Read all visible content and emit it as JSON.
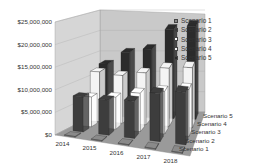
{
  "chart_data": {
    "type": "bar",
    "subtype": "3d-column",
    "title": "",
    "xlabel": "",
    "ylabel": "",
    "categories": [
      "2014",
      "2015",
      "2016",
      "2017",
      "2018"
    ],
    "series": [
      {
        "name": "Scenario 1",
        "values": [
          0,
          0,
          0,
          0,
          0
        ],
        "color": "#8a8a8a"
      },
      {
        "name": "Scenario 2",
        "values": [
          8000000,
          8000000,
          8500000,
          11000000,
          12000000
        ],
        "color": "#3d3d3d"
      },
      {
        "name": "Scenario 3",
        "values": [
          7000000,
          7500000,
          9000000,
          10000000,
          11000000
        ],
        "color": "#ffffff"
      },
      {
        "name": "Scenario 4",
        "values": [
          12000000,
          11500000,
          12500000,
          14000000,
          14500000
        ],
        "color": "#f4f4f4"
      },
      {
        "name": "Scenario 5",
        "values": [
          13000000,
          16000000,
          17000000,
          22000000,
          23000000
        ],
        "color": "#2b2b2b"
      }
    ],
    "ylim": [
      0,
      25000000
    ],
    "yticks": [
      "$0",
      "$5,000,000",
      "$10,000,000",
      "$15,000,000",
      "$20,000,000",
      "$25,000,000"
    ],
    "grid": true,
    "legend_position": "right",
    "depth_axis_labels": [
      "Scenario 5",
      "Scenario 4",
      "Scenario 3",
      "Scenario 2",
      "Scenario 1"
    ]
  },
  "legend": {
    "items": [
      {
        "label": "Scenario 1",
        "color": "#8a8a8a"
      },
      {
        "label": "Scenario 2",
        "color": "#3d3d3d"
      },
      {
        "label": "Scenario 3",
        "color": "#ffffff"
      },
      {
        "label": "Scenario 4",
        "color": "#f4f4f4"
      },
      {
        "label": "Scenario 5",
        "color": "#2b2b2b"
      }
    ]
  }
}
